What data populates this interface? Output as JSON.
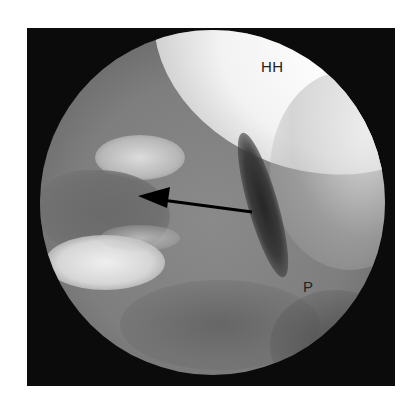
{
  "figure": {
    "type": "arthroscopic-image",
    "labels": {
      "humeral_head": "HH",
      "p_marker": "P"
    },
    "annotations": [
      {
        "type": "arrow",
        "direction": "left",
        "tail": [
          252,
          212
        ],
        "tip": [
          138,
          196
        ],
        "color": "#000000"
      }
    ],
    "colors": {
      "frame": "#0b0b0b",
      "bright_region": "#f4f4f4",
      "tissue_gray": "#7e7e7e",
      "dark_streak": "#2a2a2a"
    }
  }
}
